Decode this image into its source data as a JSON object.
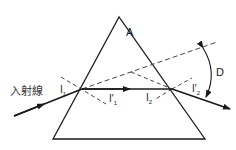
{
  "diagram": {
    "labels": {
      "apex": "A",
      "incident_ray": "入射線",
      "angle_i1": "I",
      "angle_i1_sub": "1",
      "angle_r1": "I'",
      "angle_r1_sub": "1",
      "angle_i2": "I",
      "angle_i2_sub": "2",
      "angle_r2": "I'",
      "angle_r2_sub": "2",
      "deviation": "D"
    },
    "colors": {
      "line": "#1a1a1a",
      "dashed": "#444444",
      "background": "#ffffff"
    }
  }
}
